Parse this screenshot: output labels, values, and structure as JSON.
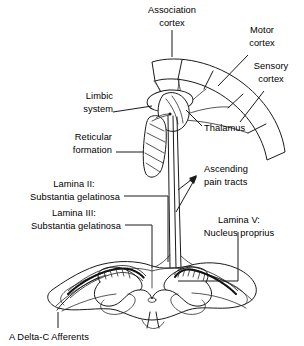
{
  "figure": {
    "background_color": "#ffffff",
    "ink_color": "#1a1a1a"
  },
  "labels": {
    "association_cortex": {
      "line1": "Association",
      "line2": "cortex"
    },
    "motor_cortex": {
      "line1": "Motor",
      "line2": "cortex"
    },
    "sensory_cortex": {
      "line1": "Sensory",
      "line2": "cortex"
    },
    "limbic_system": {
      "line1": "Limbic",
      "line2": "system"
    },
    "reticular_formation": {
      "line1": "Reticular",
      "line2": "formation"
    },
    "thalamus": {
      "line1": "Thalamus"
    },
    "ascending_pain_tracts": {
      "line1": "Ascending",
      "line2": "pain tracts"
    },
    "lamina_ii": {
      "line1": "Lamina II:",
      "line2": "Substantia gelatinosa"
    },
    "lamina_iii": {
      "line1": "Lamina III:",
      "line2": "Substantia gelatinosa"
    },
    "lamina_v": {
      "line1": "Lamina V:",
      "line2": "Nucleus proprius"
    },
    "afferents": {
      "line1": "A Delta-C Afferents"
    }
  },
  "structures": [
    {
      "name": "cerebral-cortex-band",
      "label": "Cerebral cortex band",
      "segments": 4
    },
    {
      "name": "thalamus-body",
      "label": "Thalamus"
    },
    {
      "name": "limbic-system-oval",
      "label": "Limbic system"
    },
    {
      "name": "reticular-formation-body",
      "label": "Reticular formation"
    },
    {
      "name": "spinal-cord-cross-section",
      "label": "Spinal cord cross section"
    },
    {
      "name": "gray-matter-butterfly",
      "label": "Gray matter butterfly"
    },
    {
      "name": "substantia-gelatinosa-band",
      "label": "Substantia gelatinosa stippled band"
    },
    {
      "name": "ascending-tract-lines",
      "label": "Ascending tract lines"
    },
    {
      "name": "afferent-fiber",
      "label": "A Delta-C afferent fiber"
    }
  ]
}
